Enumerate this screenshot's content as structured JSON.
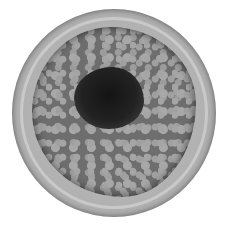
{
  "image": {
    "description": "Grayscale illustration of a blood vessel cross-section with plaque buildup narrowing the lumen",
    "subject": "artery-cross-section",
    "colors": {
      "background": "#ffffff",
      "vessel_wall": "#b0b0b0",
      "plaque": "#6e6e6e",
      "lumen": "#141414"
    }
  }
}
